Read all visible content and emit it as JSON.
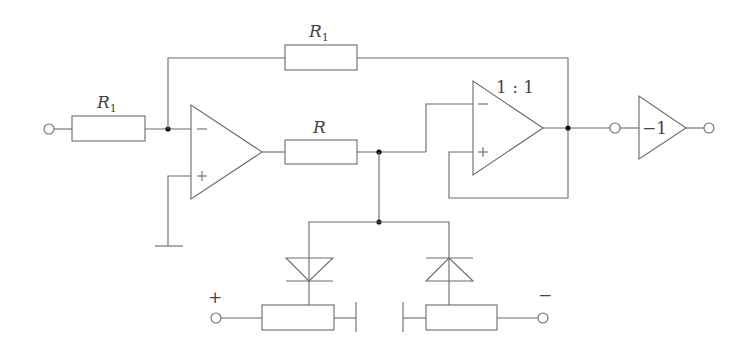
{
  "diagram": {
    "type": "circuit-schematic",
    "colors": {
      "wire": "#6a6a6a",
      "junction": "#111111",
      "text": "#444444",
      "background": "#ffffff"
    },
    "labels": {
      "input_resistor": "R",
      "input_resistor_sub": "1",
      "feedback_resistor": "R",
      "feedback_resistor_sub": "1",
      "series_resistor": "R",
      "follower_ratio": "1 : 1",
      "inverter_gain": "−1",
      "opamp1_minus": "−",
      "opamp1_plus": "+",
      "opamp2_minus": "−",
      "opamp2_plus": "+",
      "supply_positive": "+",
      "supply_negative": "−"
    },
    "components": [
      {
        "id": "input-terminal",
        "kind": "terminal"
      },
      {
        "id": "R1-input",
        "kind": "resistor",
        "label": "R1"
      },
      {
        "id": "R1-feedback",
        "kind": "resistor",
        "label": "R1"
      },
      {
        "id": "opamp-1",
        "kind": "op-amp",
        "inputs": [
          "−",
          "+"
        ]
      },
      {
        "id": "R-series",
        "kind": "resistor",
        "label": "R"
      },
      {
        "id": "opamp-2",
        "kind": "op-amp (follower)",
        "label": "1 : 1"
      },
      {
        "id": "inverter",
        "kind": "amplifier",
        "label": "−1"
      },
      {
        "id": "diode-left",
        "kind": "diode"
      },
      {
        "id": "diode-right",
        "kind": "diode"
      },
      {
        "id": "pot-positive",
        "kind": "potentiometer",
        "supply": "+"
      },
      {
        "id": "pot-negative",
        "kind": "potentiometer",
        "supply": "−"
      },
      {
        "id": "ground",
        "kind": "ground"
      }
    ]
  }
}
